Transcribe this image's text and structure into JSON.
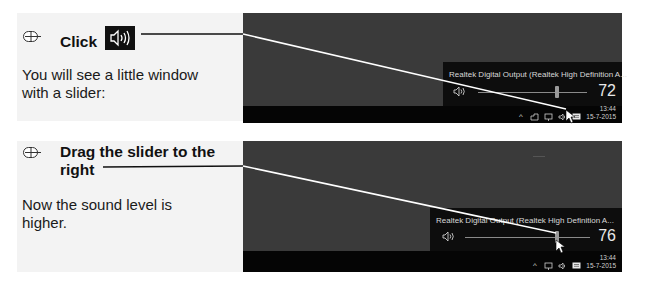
{
  "step1": {
    "instruction": "Click",
    "description_line1": "You will see a little window",
    "description_line2": "with a slider:",
    "screenshot": {
      "device_name": "Realtek Digital Output (Realtek High Definition A...",
      "volume": "72",
      "clock_time": "13:44",
      "clock_date": "15-7-2015"
    }
  },
  "step2": {
    "instruction_line1": "Drag the slider to the",
    "instruction_line2": "right",
    "description_line1": "Now the sound level is",
    "description_line2": "higher.",
    "screenshot": {
      "device_name": "Realtek Digital Output (Realtek High Definition A...",
      "volume": "76",
      "clock_time": "13:44",
      "clock_date": "15-7-2015"
    }
  },
  "icons": {
    "mouse": "mouse-icon",
    "speaker": "speaker-icon",
    "cursor": "mouse-pointer-icon",
    "tray_chevron": "^",
    "action_center": "action-center-icon"
  },
  "colors": {
    "panel_bg": "#f3f3f3",
    "desktop_bg": "#3a3a3a",
    "taskbar_bg": "#050505",
    "popup_bg": "#0d0d0d",
    "callout_line": "#ffffff"
  }
}
